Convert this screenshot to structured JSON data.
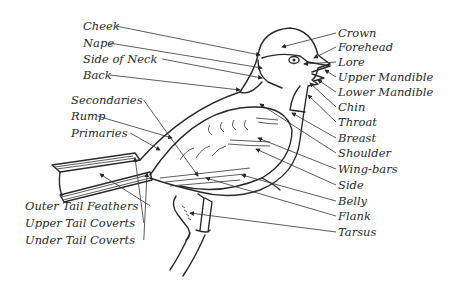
{
  "colors": {
    "ink": "#2a2a2a",
    "background": "#ffffff"
  },
  "labels_left": [
    {
      "id": "cheek",
      "text": "Cheek",
      "x": 83,
      "y": 30,
      "tx": 260,
      "ty": 55
    },
    {
      "id": "nape",
      "text": "Nape",
      "x": 83,
      "y": 47,
      "tx": 262,
      "ty": 68
    },
    {
      "id": "side-of-neck",
      "text": "Side of Neck",
      "x": 83,
      "y": 63,
      "tx": 262,
      "ty": 78
    },
    {
      "id": "back",
      "text": "Back",
      "x": 83,
      "y": 79,
      "tx": 240,
      "ty": 90
    },
    {
      "id": "secondaries",
      "text": "Secondaries",
      "x": 71,
      "y": 104,
      "tx": 198,
      "ty": 176
    },
    {
      "id": "rump",
      "text": "Rump",
      "x": 71,
      "y": 120,
      "tx": 172,
      "ty": 138
    },
    {
      "id": "primaries",
      "text": "Primaries",
      "x": 71,
      "y": 137,
      "tx": 160,
      "ty": 150
    },
    {
      "id": "outer-tail-feathers",
      "text": "Outer Tail Feathers",
      "x": 25,
      "y": 210,
      "tx": 100,
      "ty": 174
    },
    {
      "id": "upper-tail-coverts",
      "text": "Upper Tail Coverts",
      "x": 25,
      "y": 227,
      "tx": 135,
      "ty": 158
    },
    {
      "id": "under-tail-coverts",
      "text": "Under Tail Coverts",
      "x": 25,
      "y": 244,
      "tx": 147,
      "ty": 173
    }
  ],
  "labels_right": [
    {
      "id": "crown",
      "text": "Crown",
      "x": 338,
      "y": 37,
      "tx": 282,
      "ty": 47
    },
    {
      "id": "forehead",
      "text": "Forehead",
      "x": 338,
      "y": 51,
      "tx": 314,
      "ty": 58
    },
    {
      "id": "lore",
      "text": "Lore",
      "x": 338,
      "y": 66,
      "tx": 304,
      "ty": 64
    },
    {
      "id": "upper-mandible",
      "text": "Upper Mandible",
      "x": 338,
      "y": 81,
      "tx": 325,
      "ty": 70
    },
    {
      "id": "lower-mandible",
      "text": "Lower Mandible",
      "x": 338,
      "y": 96,
      "tx": 318,
      "ty": 80
    },
    {
      "id": "chin",
      "text": "Chin",
      "x": 338,
      "y": 111,
      "tx": 310,
      "ty": 83
    },
    {
      "id": "throat",
      "text": "Throat",
      "x": 338,
      "y": 126,
      "tx": 308,
      "ty": 95
    },
    {
      "id": "breast",
      "text": "Breast",
      "x": 338,
      "y": 142,
      "tx": 292,
      "ty": 113
    },
    {
      "id": "shoulder",
      "text": "Shoulder",
      "x": 338,
      "y": 157,
      "tx": 260,
      "ty": 104
    },
    {
      "id": "wing-bars",
      "text": "Wing-bars",
      "x": 338,
      "y": 173,
      "tx": 258,
      "ty": 138
    },
    {
      "id": "side",
      "text": "Side",
      "x": 338,
      "y": 189,
      "tx": 256,
      "ty": 149
    },
    {
      "id": "belly",
      "text": "Belly",
      "x": 338,
      "y": 205,
      "tx": 242,
      "ty": 175
    },
    {
      "id": "flank",
      "text": "Flank",
      "x": 338,
      "y": 220,
      "tx": 206,
      "ty": 178
    },
    {
      "id": "tarsus",
      "text": "Tarsus",
      "x": 338,
      "y": 236,
      "tx": 190,
      "ty": 213
    }
  ]
}
